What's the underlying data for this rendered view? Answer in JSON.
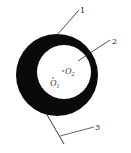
{
  "diagram": {
    "type": "eccentric-ring-cross-section",
    "colors": {
      "ring_fill": "#0a0a0a",
      "hole_fill": "#ffffff",
      "line": "#222222",
      "background": "#ffffff"
    },
    "outer_circle": {
      "center_label": "O",
      "center_subscript": "1"
    },
    "inner_circle": {
      "center_label": "O",
      "center_subscript": "2"
    },
    "leaders": [
      {
        "label": "1"
      },
      {
        "label": "2"
      },
      {
        "label": "3"
      }
    ]
  }
}
